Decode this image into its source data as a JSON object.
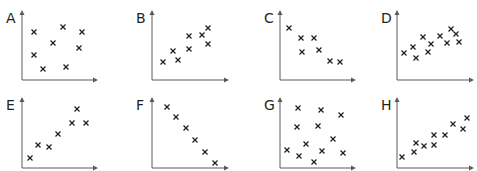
{
  "colors": {
    "axis": "#5a5a5a",
    "marker": "#231f20",
    "label": "#231f20"
  },
  "chart_data": [
    {
      "type": "scatter",
      "title": "A",
      "description": "no correlation",
      "points": [
        [
          34,
          32
        ],
        [
          63,
          27
        ],
        [
          82,
          32
        ],
        [
          53,
          43
        ],
        [
          79,
          48
        ],
        [
          34,
          55
        ],
        [
          43,
          69
        ],
        [
          66,
          67
        ]
      ]
    },
    {
      "type": "scatter",
      "title": "B",
      "description": "positive correlation",
      "points": [
        [
          43,
          62
        ],
        [
          53,
          51
        ],
        [
          58,
          60
        ],
        [
          69,
          36
        ],
        [
          69,
          49
        ],
        [
          82,
          35
        ],
        [
          88,
          28
        ],
        [
          88,
          44
        ]
      ]
    },
    {
      "type": "scatter",
      "title": "C",
      "description": "negative correlation",
      "points": [
        [
          49,
          28
        ],
        [
          61,
          38
        ],
        [
          74,
          38
        ],
        [
          62,
          52
        ],
        [
          79,
          50
        ],
        [
          90,
          61
        ],
        [
          100,
          62
        ]
      ]
    },
    {
      "type": "scatter",
      "title": "D",
      "description": "weak positive correlation",
      "points": [
        [
          47,
          53
        ],
        [
          56,
          47
        ],
        [
          59,
          58
        ],
        [
          66,
          37
        ],
        [
          74,
          44
        ],
        [
          71,
          52
        ],
        [
          83,
          36
        ],
        [
          90,
          43
        ],
        [
          94,
          29
        ],
        [
          99,
          34
        ],
        [
          102,
          42
        ]
      ]
    },
    {
      "type": "scatter",
      "title": "E",
      "description": "positive correlation",
      "points": [
        [
          30,
          73
        ],
        [
          38,
          60
        ],
        [
          49,
          62
        ],
        [
          58,
          49
        ],
        [
          72,
          38
        ],
        [
          77,
          24
        ],
        [
          86,
          38
        ]
      ]
    },
    {
      "type": "scatter",
      "title": "F",
      "description": "strong negative correlation",
      "points": [
        [
          47,
          22
        ],
        [
          56,
          32
        ],
        [
          66,
          43
        ],
        [
          75,
          55
        ],
        [
          85,
          67
        ],
        [
          95,
          78
        ]
      ]
    },
    {
      "type": "scatter",
      "title": "G",
      "description": "no correlation",
      "points": [
        [
          58,
          23
        ],
        [
          81,
          25
        ],
        [
          101,
          30
        ],
        [
          57,
          42
        ],
        [
          78,
          41
        ],
        [
          93,
          54
        ],
        [
          66,
          59
        ],
        [
          47,
          65
        ],
        [
          59,
          71
        ],
        [
          82,
          66
        ],
        [
          103,
          68
        ],
        [
          74,
          77
        ]
      ]
    },
    {
      "type": "scatter",
      "title": "H",
      "description": "positive correlation",
      "points": [
        [
          45,
          72
        ],
        [
          57,
          67
        ],
        [
          59,
          58
        ],
        [
          67,
          61
        ],
        [
          77,
          50
        ],
        [
          77,
          60
        ],
        [
          88,
          50
        ],
        [
          96,
          39
        ],
        [
          106,
          44
        ],
        [
          110,
          33
        ]
      ]
    }
  ],
  "panels": [
    {
      "label": "A",
      "left": 0,
      "top": 0,
      "axis_x": 22,
      "axis_top": 10,
      "axis_y": 80,
      "axis_right": 98
    },
    {
      "label": "B",
      "left": 120,
      "top": 0,
      "axis_x": 32,
      "axis_top": 10,
      "axis_y": 80,
      "axis_right": 109
    },
    {
      "label": "C",
      "left": 240,
      "top": 0,
      "axis_x": 40,
      "axis_top": 10,
      "axis_y": 80,
      "axis_right": 116
    },
    {
      "label": "D",
      "left": 357,
      "top": 0,
      "axis_x": 40,
      "axis_top": 10,
      "axis_y": 80,
      "axis_right": 117
    },
    {
      "label": "E",
      "left": 0,
      "top": 85,
      "axis_x": 22,
      "axis_top": 12,
      "axis_y": 83,
      "axis_right": 98
    },
    {
      "label": "F",
      "left": 120,
      "top": 85,
      "axis_x": 32,
      "axis_top": 12,
      "axis_y": 83,
      "axis_right": 109
    },
    {
      "label": "G",
      "left": 240,
      "top": 85,
      "axis_x": 40,
      "axis_top": 12,
      "axis_y": 83,
      "axis_right": 116
    },
    {
      "label": "H",
      "left": 357,
      "top": 85,
      "axis_x": 40,
      "axis_top": 12,
      "axis_y": 83,
      "axis_right": 117
    }
  ]
}
